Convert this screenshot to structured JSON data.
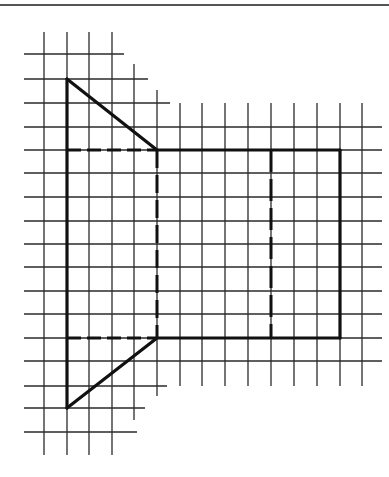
{
  "figure": {
    "colors": {
      "grid": "#2a2a2a",
      "outline": "#111111",
      "background": "#ffffff",
      "rule": "#555555"
    },
    "top_rule": {
      "x1": 0,
      "x2": 389,
      "y": 5
    },
    "grid": {
      "horizontal_lines": [
        {
          "y": 54,
          "x1": 24,
          "x2": 124
        },
        {
          "y": 79,
          "x1": 24,
          "x2": 148
        },
        {
          "y": 103,
          "x1": 24,
          "x2": 170
        },
        {
          "y": 127,
          "x1": 24,
          "x2": 382
        },
        {
          "y": 150,
          "x1": 24,
          "x2": 382
        },
        {
          "y": 173,
          "x1": 24,
          "x2": 382
        },
        {
          "y": 197,
          "x1": 24,
          "x2": 382
        },
        {
          "y": 221,
          "x1": 24,
          "x2": 382
        },
        {
          "y": 244,
          "x1": 24,
          "x2": 382
        },
        {
          "y": 267,
          "x1": 24,
          "x2": 382
        },
        {
          "y": 291,
          "x1": 24,
          "x2": 382
        },
        {
          "y": 314,
          "x1": 24,
          "x2": 382
        },
        {
          "y": 338,
          "x1": 24,
          "x2": 382
        },
        {
          "y": 361,
          "x1": 24,
          "x2": 382
        },
        {
          "y": 386,
          "x1": 24,
          "x2": 167
        },
        {
          "y": 408,
          "x1": 24,
          "x2": 145
        },
        {
          "y": 432,
          "x1": 24,
          "x2": 137
        }
      ],
      "vertical_lines": [
        {
          "x": 44,
          "y1": 32,
          "y2": 455
        },
        {
          "x": 67,
          "y1": 32,
          "y2": 455
        },
        {
          "x": 89,
          "y1": 32,
          "y2": 455
        },
        {
          "x": 112,
          "y1": 32,
          "y2": 455
        },
        {
          "x": 134,
          "y1": 64,
          "y2": 420
        },
        {
          "x": 157,
          "y1": 90,
          "y2": 396
        },
        {
          "x": 180,
          "y1": 103,
          "y2": 386
        },
        {
          "x": 202,
          "y1": 103,
          "y2": 386
        },
        {
          "x": 225,
          "y1": 103,
          "y2": 386
        },
        {
          "x": 248,
          "y1": 103,
          "y2": 386
        },
        {
          "x": 271,
          "y1": 103,
          "y2": 386
        },
        {
          "x": 294,
          "y1": 103,
          "y2": 386
        },
        {
          "x": 317,
          "y1": 103,
          "y2": 386
        },
        {
          "x": 340,
          "y1": 103,
          "y2": 386
        },
        {
          "x": 362,
          "y1": 103,
          "y2": 386
        }
      ]
    },
    "solid_edges": [
      {
        "name": "left-edge",
        "x1": 67,
        "y1": 79,
        "x2": 67,
        "y2": 408
      },
      {
        "name": "top-triangle-hyp",
        "x1": 67,
        "y1": 79,
        "x2": 157,
        "y2": 150
      },
      {
        "name": "bottom-triangle-hyp",
        "x1": 67,
        "y1": 408,
        "x2": 157,
        "y2": 338
      },
      {
        "name": "rect-top-edge",
        "x1": 157,
        "y1": 150,
        "x2": 340,
        "y2": 150
      },
      {
        "name": "rect-right-edge",
        "x1": 340,
        "y1": 150,
        "x2": 340,
        "y2": 338
      },
      {
        "name": "rect-bottom-edge",
        "x1": 157,
        "y1": 338,
        "x2": 340,
        "y2": 338
      }
    ],
    "dashed_edges": [
      {
        "name": "fold-top",
        "x1": 67,
        "y1": 150,
        "x2": 157,
        "y2": 150,
        "dash": "14 6"
      },
      {
        "name": "fold-bottom",
        "x1": 67,
        "y1": 338,
        "x2": 157,
        "y2": 338,
        "dash": "14 6"
      },
      {
        "name": "fold-middle",
        "x1": 157,
        "y1": 150,
        "x2": 157,
        "y2": 338,
        "dash": "18 7"
      },
      {
        "name": "fold-right",
        "x1": 271,
        "y1": 150,
        "x2": 271,
        "y2": 338,
        "dash": "22 7"
      }
    ]
  }
}
